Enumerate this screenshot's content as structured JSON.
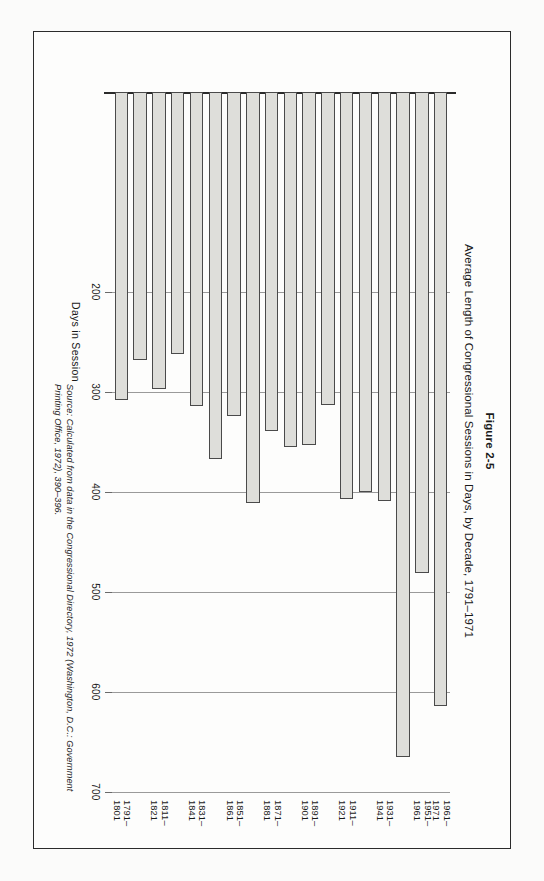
{
  "figure": {
    "number": "Figure 2-5",
    "title": "Average Length of Congressional Sessions in Days, by Decade, 1791–1971",
    "source_label": "Source:",
    "source_text": "Calculated from data in the Congressional Directory, 1972 (Washington, D.C.: Government Printing Office, 1972), 390–396.",
    "frame_color": "#2b2b2b",
    "bar_fill": "#dededa",
    "bar_stroke": "#4a4a4a",
    "grid_color": "#9a9a9a"
  },
  "chart_data": {
    "type": "bar",
    "orientation": "horizontal",
    "title": "Average Length of Congressional Sessions in Days, by Decade, 1791–1971",
    "xlabel": "Days in Session",
    "ylabel": "",
    "xlim": [
      0,
      700
    ],
    "grid": true,
    "legend": "none",
    "tick_values": [
      200,
      300,
      400,
      500,
      600,
      700
    ],
    "tick_labels": [
      "200",
      "300",
      "400",
      "500",
      "600",
      "700"
    ],
    "categories": [
      "1791–1801",
      "1801–1811",
      "1811–1821",
      "1821–1831",
      "1831–1841",
      "1841–1851",
      "1851–1861",
      "1861–1871",
      "1871–1881",
      "1881–1891",
      "1891–1901",
      "1901–1911",
      "1911–1921",
      "1921–1931",
      "1931–1941",
      "1941–1951",
      "1951–1961",
      "1961–1971"
    ],
    "values": [
      308,
      268,
      297,
      262,
      314,
      367,
      324,
      411,
      339,
      355,
      353,
      313,
      407,
      400,
      409,
      665,
      481,
      614
    ],
    "displayed_category_labels": [
      {
        "index": 0,
        "line1": "1791–",
        "line2": "1801"
      },
      {
        "index": 2,
        "line1": "1811–",
        "line2": "1821"
      },
      {
        "index": 4,
        "line1": "1831–",
        "line2": "1841"
      },
      {
        "index": 6,
        "line1": "1851–",
        "line2": "1861"
      },
      {
        "index": 8,
        "line1": "1871–",
        "line2": "1881"
      },
      {
        "index": 10,
        "line1": "1891–",
        "line2": "1901"
      },
      {
        "index": 12,
        "line1": "1911–",
        "line2": "1921"
      },
      {
        "index": 14,
        "line1": "1931–",
        "line2": "1941"
      },
      {
        "index": 16,
        "line1": "1951–",
        "line2": "1961"
      },
      {
        "index": 17,
        "line1": "1961–",
        "line2": "1971"
      }
    ]
  }
}
